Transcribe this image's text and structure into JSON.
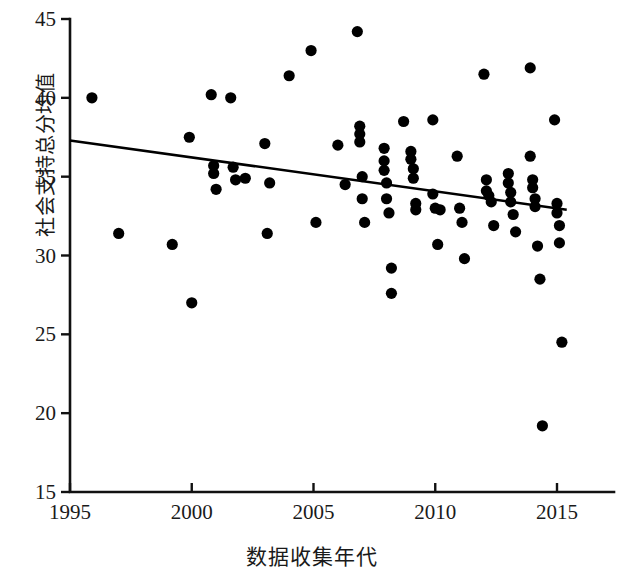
{
  "chart_data": {
    "type": "scatter",
    "title": "",
    "xlabel": "数据收集年代",
    "ylabel": "社会支持总分均值",
    "xlim": [
      1995,
      2015.5
    ],
    "ylim": [
      15,
      45
    ],
    "xticks": [
      1995,
      2000,
      2005,
      2010,
      2015
    ],
    "yticks": [
      15,
      20,
      25,
      30,
      35,
      40,
      45
    ],
    "grid": false,
    "legend": null,
    "marker_color": "#000000",
    "marker_shape": "filled-circle",
    "line_color": "#000000",
    "trendline": {
      "name": "linear fit",
      "x": [
        1995,
        2015.4
      ],
      "y": [
        37.3,
        32.9
      ]
    },
    "points": [
      [
        1995.9,
        40.0
      ],
      [
        1997.0,
        31.4
      ],
      [
        1999.2,
        30.7
      ],
      [
        1999.9,
        37.5
      ],
      [
        2000.0,
        27.0
      ],
      [
        2000.8,
        40.2
      ],
      [
        2000.9,
        35.7
      ],
      [
        2000.9,
        35.2
      ],
      [
        2001.0,
        34.2
      ],
      [
        2001.6,
        40.0
      ],
      [
        2001.7,
        35.6
      ],
      [
        2001.8,
        34.8
      ],
      [
        2002.2,
        34.9
      ],
      [
        2003.0,
        37.1
      ],
      [
        2003.1,
        31.4
      ],
      [
        2003.2,
        34.6
      ],
      [
        2004.0,
        41.4
      ],
      [
        2004.9,
        43.0
      ],
      [
        2005.1,
        32.1
      ],
      [
        2006.0,
        37.0
      ],
      [
        2006.3,
        34.5
      ],
      [
        2006.8,
        44.2
      ],
      [
        2006.9,
        38.2
      ],
      [
        2006.9,
        37.7
      ],
      [
        2006.9,
        37.2
      ],
      [
        2007.0,
        35.0
      ],
      [
        2007.0,
        33.6
      ],
      [
        2007.1,
        32.1
      ],
      [
        2007.9,
        36.8
      ],
      [
        2007.9,
        36.0
      ],
      [
        2007.9,
        35.4
      ],
      [
        2008.0,
        34.6
      ],
      [
        2008.0,
        33.6
      ],
      [
        2008.1,
        32.7
      ],
      [
        2008.2,
        29.2
      ],
      [
        2008.2,
        27.6
      ],
      [
        2008.7,
        38.5
      ],
      [
        2009.0,
        36.6
      ],
      [
        2009.0,
        36.1
      ],
      [
        2009.1,
        35.5
      ],
      [
        2009.1,
        34.9
      ],
      [
        2009.2,
        33.3
      ],
      [
        2009.2,
        32.9
      ],
      [
        2009.9,
        38.6
      ],
      [
        2009.9,
        33.9
      ],
      [
        2010.0,
        33.0
      ],
      [
        2010.1,
        30.7
      ],
      [
        2010.2,
        32.9
      ],
      [
        2010.9,
        36.3
      ],
      [
        2011.0,
        33.0
      ],
      [
        2011.1,
        32.1
      ],
      [
        2011.2,
        29.8
      ],
      [
        2012.0,
        41.5
      ],
      [
        2012.1,
        34.8
      ],
      [
        2012.1,
        34.1
      ],
      [
        2012.2,
        33.8
      ],
      [
        2012.3,
        33.4
      ],
      [
        2012.4,
        31.9
      ],
      [
        2013.0,
        35.2
      ],
      [
        2013.0,
        34.6
      ],
      [
        2013.1,
        34.0
      ],
      [
        2013.1,
        33.4
      ],
      [
        2013.2,
        32.6
      ],
      [
        2013.3,
        31.5
      ],
      [
        2013.9,
        41.9
      ],
      [
        2013.9,
        36.3
      ],
      [
        2014.0,
        34.8
      ],
      [
        2014.0,
        34.3
      ],
      [
        2014.1,
        33.6
      ],
      [
        2014.1,
        33.1
      ],
      [
        2014.2,
        30.6
      ],
      [
        2014.3,
        28.5
      ],
      [
        2014.4,
        19.2
      ],
      [
        2014.9,
        38.6
      ],
      [
        2015.0,
        33.3
      ],
      [
        2015.0,
        32.7
      ],
      [
        2015.1,
        31.9
      ],
      [
        2015.1,
        30.8
      ],
      [
        2015.2,
        24.5
      ]
    ]
  },
  "axes": {
    "y_tick_labels": [
      "45",
      "40",
      "35",
      "30",
      "25",
      "20",
      "15"
    ],
    "x_tick_labels": [
      "1995",
      "2000",
      "2005",
      "2010",
      "2015"
    ]
  }
}
